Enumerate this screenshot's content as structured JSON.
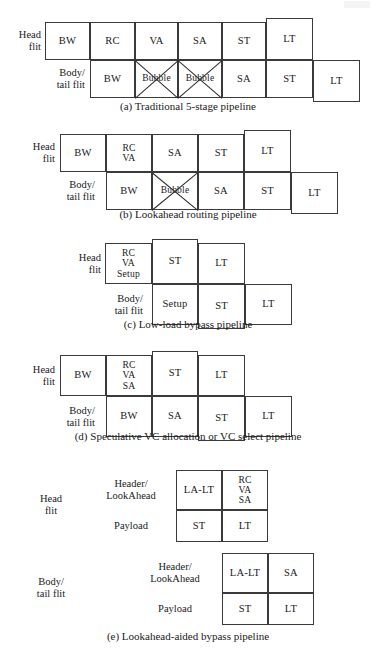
{
  "figure": {
    "kind": "router-pipeline-stage-diagrams",
    "panels": [
      {
        "id": "a",
        "caption": "(a) Traditional 5-stage pipeline",
        "rows": [
          {
            "label": "Head\nflit",
            "cells": [
              {
                "text": "BW",
                "bubble": false
              },
              {
                "text": "RC",
                "bubble": false
              },
              {
                "text": "VA",
                "bubble": false
              },
              {
                "text": "SA",
                "bubble": false
              },
              {
                "text": "ST",
                "bubble": false
              },
              {
                "text": "LT",
                "bubble": false
              }
            ]
          },
          {
            "label": "Body/\ntail flit",
            "cells": [
              {
                "text": "BW",
                "bubble": false
              },
              {
                "text": "Bubble",
                "bubble": true
              },
              {
                "text": "Bubble",
                "bubble": true
              },
              {
                "text": "SA",
                "bubble": false
              },
              {
                "text": "ST",
                "bubble": false
              },
              {
                "text": "LT",
                "bubble": false
              }
            ]
          }
        ]
      },
      {
        "id": "b",
        "caption": "(b) Lookahead routing pipeline",
        "rows": [
          {
            "label": "Head\nflit",
            "cells": [
              {
                "text": "BW",
                "bubble": false
              },
              {
                "text": "RC\nVA",
                "bubble": false
              },
              {
                "text": "SA",
                "bubble": false
              },
              {
                "text": "ST",
                "bubble": false
              },
              {
                "text": "LT",
                "bubble": false
              }
            ]
          },
          {
            "label": "Body/\ntail flit",
            "cells": [
              {
                "text": "BW",
                "bubble": false
              },
              {
                "text": "Bubble",
                "bubble": true
              },
              {
                "text": "SA",
                "bubble": false
              },
              {
                "text": "ST",
                "bubble": false
              },
              {
                "text": "LT",
                "bubble": false
              }
            ]
          }
        ]
      },
      {
        "id": "c",
        "caption": "(c) Low-load bypass pipeline",
        "rows": [
          {
            "label": "Head\nflit",
            "cells": [
              {
                "text": "RC\nVA\nSetup",
                "bubble": false
              },
              {
                "text": "ST",
                "bubble": false
              },
              {
                "text": "LT",
                "bubble": false
              }
            ]
          },
          {
            "label": "Body/\ntail flit",
            "cells": [
              {
                "text": "Setup",
                "bubble": false
              },
              {
                "text": "ST",
                "bubble": false
              },
              {
                "text": "LT",
                "bubble": false
              }
            ]
          }
        ]
      },
      {
        "id": "d",
        "caption": "(d) Speculative VC allocation or VC select pipeline",
        "rows": [
          {
            "label": "Head\nflit",
            "cells": [
              {
                "text": "BW",
                "bubble": false
              },
              {
                "text": "RC\nVA\nSA",
                "bubble": false
              },
              {
                "text": "ST",
                "bubble": false
              },
              {
                "text": "LT",
                "bubble": false
              }
            ]
          },
          {
            "label": "Body/\ntail flit",
            "cells": [
              {
                "text": "BW",
                "bubble": false
              },
              {
                "text": "SA",
                "bubble": false
              },
              {
                "text": "ST",
                "bubble": false
              },
              {
                "text": "LT",
                "bubble": false
              }
            ]
          }
        ]
      },
      {
        "id": "e",
        "caption": "(e) Lookahead-aided bypass pipeline",
        "groups": [
          {
            "label": "Head\nflit",
            "rows": [
              {
                "sublabel": "Header/\nLookAhead",
                "cells": [
                  {
                    "text": "LA-LT",
                    "bubble": false
                  },
                  {
                    "text": "RC\nVA\nSA",
                    "bubble": false
                  }
                ]
              },
              {
                "sublabel": "Payload",
                "cells": [
                  {
                    "text": "ST",
                    "bubble": false
                  },
                  {
                    "text": "LT",
                    "bubble": false
                  }
                ]
              }
            ]
          },
          {
            "label": "Body/\ntail flit",
            "rows": [
              {
                "sublabel": "Header/\nLookAhead",
                "cells": [
                  {
                    "text": "LA-LT",
                    "bubble": false
                  },
                  {
                    "text": "SA",
                    "bubble": false
                  }
                ]
              },
              {
                "sublabel": "Payload",
                "cells": [
                  {
                    "text": "ST",
                    "bubble": false
                  },
                  {
                    "text": "LT",
                    "bubble": false
                  }
                ]
              }
            ]
          }
        ]
      }
    ]
  },
  "colors": {
    "stroke": "#3a3a3a",
    "text": "#1a1a1a",
    "background": "#ffffff"
  }
}
